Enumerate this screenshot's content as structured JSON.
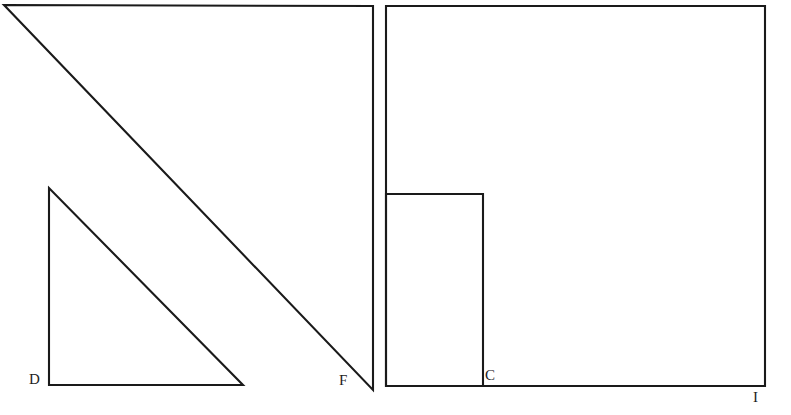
{
  "figure": {
    "background_color": "#ffffff",
    "stroke_color": "#1a1a1a",
    "canvas": {
      "width": 791,
      "height": 415
    }
  },
  "labels": {
    "d": "D",
    "f": "F",
    "c": "C",
    "i": "I"
  },
  "shapes": {
    "large_triangle": {
      "name": "large-right-triangle",
      "points": "4,5 373,6 373,390",
      "vertices": [
        {
          "x": 4,
          "y": 5
        },
        {
          "x": 373,
          "y": 6
        },
        {
          "x": 373,
          "y": 390
        }
      ],
      "right_angle_at": "top-right",
      "labeled_vertex": "F"
    },
    "small_triangle": {
      "name": "small-right-triangle",
      "points": "49,188 49,385 243,385",
      "vertices": [
        {
          "x": 49,
          "y": 188
        },
        {
          "x": 49,
          "y": 385
        },
        {
          "x": 243,
          "y": 385
        }
      ],
      "right_angle_at": "bottom-left",
      "labeled_vertex": "D"
    },
    "large_square": {
      "name": "large-square",
      "x": 386,
      "y": 6,
      "width": 379,
      "height": 380,
      "labeled_vertex": "I"
    },
    "inner_rectangle": {
      "name": "inner-rectangle",
      "x": 386,
      "y": 194,
      "width": 97,
      "height": 192,
      "labeled_vertex": "C"
    }
  }
}
